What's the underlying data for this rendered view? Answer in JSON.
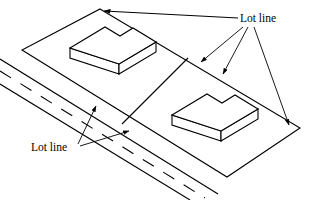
{
  "figure": {
    "canvas": {
      "width": 311,
      "height": 200
    },
    "stroke_color": "#000000",
    "fill_color": "#ffffff",
    "background": "#ffffff"
  },
  "labels": {
    "top_right": {
      "text": "Lot line",
      "x": 240,
      "y": 22,
      "anchor": "start",
      "font_size": 11.5
    },
    "bottom_left": {
      "text": "Lot line",
      "x": 31,
      "y": 151,
      "anchor": "start",
      "font_size": 11.5
    }
  },
  "geometry": {
    "lot_parcel": {
      "name": "lot-boundary-parallelogram",
      "points": "100,9 300,128 227,177 22,50"
    },
    "lot_divider": {
      "name": "interior-lot-line",
      "x1": 188,
      "y1": 58,
      "x2": 122,
      "y2": 124
    },
    "road": {
      "name": "roadway",
      "upper_edge": {
        "x1": 0,
        "y1": 59,
        "x2": 218,
        "y2": 194
      },
      "lower_edge": {
        "x1": 0,
        "y1": 84,
        "x2": 190,
        "y2": 200
      },
      "center_dashes": {
        "x1": 0,
        "y1": 71,
        "x2": 205,
        "y2": 198
      },
      "dash_pattern": "13 11"
    },
    "building_left": {
      "name": "building-left",
      "top_face": "70,48 105,27 120,36 133,28 156,42 119,64",
      "front_left_face": "70,48 70,58 119,74 119,64",
      "front_right_face": "119,64 119,74 156,52 156,42"
    },
    "building_right": {
      "name": "building-right",
      "top_face": "172,115 207,94 222,103 235,95 258,109 221,131",
      "front_left_face": "172,115 172,125 221,141 221,131",
      "front_right_face": "221,131 221,141 258,119 258,109"
    },
    "leaders": {
      "top_right_group": [
        {
          "name": "leader-to-top-corner",
          "x1": 238,
          "y1": 18,
          "x2": 103,
          "y2": 11,
          "arrow_at": "end"
        },
        {
          "name": "leader-to-divider-top",
          "x1": 243,
          "y1": 27,
          "x2": 200,
          "y2": 63,
          "arrow_at": "end"
        },
        {
          "name": "leader-to-divider-mid",
          "x1": 248,
          "y1": 27,
          "x2": 222,
          "y2": 75,
          "arrow_at": "end"
        },
        {
          "name": "leader-to-right-corner",
          "x1": 254,
          "y1": 27,
          "x2": 290,
          "y2": 126,
          "arrow_at": "end"
        }
      ],
      "bottom_left_group": [
        {
          "name": "leader-to-road-edge",
          "x1": 78,
          "y1": 145,
          "x2": 96,
          "y2": 105,
          "arrow_at": "end"
        },
        {
          "name": "leader-to-lot-edge",
          "x1": 80,
          "y1": 147,
          "x2": 130,
          "y2": 131,
          "arrow_at": "end"
        }
      ]
    }
  }
}
